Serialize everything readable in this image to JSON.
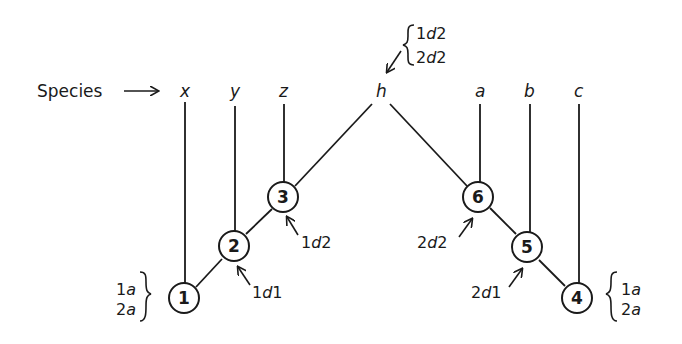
{
  "diagram": {
    "type": "phylogenetic-tree",
    "colors": {
      "ink": "#1a1a1a",
      "background": "#ffffff"
    },
    "species_label": "Species",
    "species": [
      {
        "id": "x",
        "label": "x"
      },
      {
        "id": "y",
        "label": "y"
      },
      {
        "id": "z",
        "label": "z"
      },
      {
        "id": "h",
        "label": "h"
      },
      {
        "id": "a",
        "label": "a"
      },
      {
        "id": "b",
        "label": "b"
      },
      {
        "id": "c",
        "label": "c"
      }
    ],
    "nodes": [
      {
        "id": "1",
        "label": "1"
      },
      {
        "id": "2",
        "label": "2"
      },
      {
        "id": "3",
        "label": "3"
      },
      {
        "id": "4",
        "label": "4"
      },
      {
        "id": "5",
        "label": "5"
      },
      {
        "id": "6",
        "label": "6"
      }
    ],
    "edges": [
      [
        "x",
        "1"
      ],
      [
        "1",
        "2"
      ],
      [
        "y",
        "2"
      ],
      [
        "2",
        "3"
      ],
      [
        "z",
        "3"
      ],
      [
        "3",
        "h"
      ],
      [
        "h",
        "6"
      ],
      [
        "a",
        "6"
      ],
      [
        "6",
        "5"
      ],
      [
        "b",
        "5"
      ],
      [
        "5",
        "4"
      ],
      [
        "c",
        "4"
      ]
    ],
    "annotations": {
      "h": {
        "lines": [
          {
            "num": "1",
            "letter": "d",
            "suffix": "2"
          },
          {
            "num": "2",
            "letter": "d",
            "suffix": "2"
          }
        ]
      },
      "node1": {
        "lines": [
          {
            "num": "1",
            "letter": "a"
          },
          {
            "num": "2",
            "letter": "a"
          }
        ]
      },
      "node4": {
        "lines": [
          {
            "num": "1",
            "letter": "a"
          },
          {
            "num": "2",
            "letter": "a"
          }
        ]
      },
      "node2": {
        "num": "1",
        "letter": "d",
        "suffix": "1"
      },
      "node3": {
        "num": "1",
        "letter": "d",
        "suffix": "2"
      },
      "node5": {
        "num": "2",
        "letter": "d",
        "suffix": "1"
      },
      "node6": {
        "num": "2",
        "letter": "d",
        "suffix": "2"
      }
    }
  }
}
